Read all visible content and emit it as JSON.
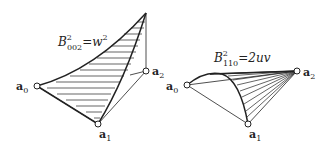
{
  "figures": [
    {
      "id": "left",
      "formula": {
        "B": "B",
        "sup": "2",
        "sub": "002",
        "eq": "=",
        "rhs_var": "w",
        "rhs_sup": "2"
      },
      "vertices": [
        {
          "name": "a",
          "index": "0"
        },
        {
          "name": "a",
          "index": "1"
        },
        {
          "name": "a",
          "index": "2"
        }
      ]
    },
    {
      "id": "right",
      "formula": {
        "B": "B",
        "sup": "2",
        "sub": "110",
        "eq": "=",
        "rhs": "2uv"
      },
      "vertices": [
        {
          "name": "a",
          "index": "0"
        },
        {
          "name": "a",
          "index": "1"
        },
        {
          "name": "a",
          "index": "2"
        }
      ]
    }
  ],
  "colors": {
    "stroke": "#222222",
    "background": "#ffffff"
  }
}
